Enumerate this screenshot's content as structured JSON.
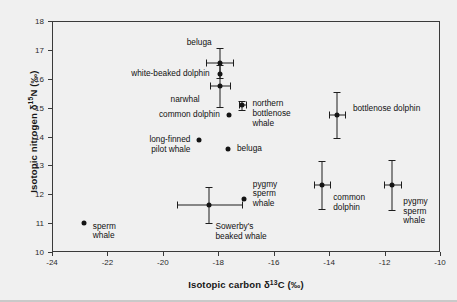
{
  "chart_data": {
    "type": "scatter",
    "title": "",
    "xlabel_parts": {
      "pre": "Isotopic carbon δ",
      "sup": "13",
      "post": "C (‰)"
    },
    "ylabel_parts": {
      "pre": "Isotopic nitrogen δ",
      "sup": "15",
      "post": "N (‰)"
    },
    "xlabel": "Isotopic carbon δ13C (‰)",
    "ylabel": "Isotopic nitrogen δ15N (‰)",
    "xlim": [
      -24,
      -10
    ],
    "ylim": [
      10,
      18
    ],
    "xticks": [
      -24,
      -22,
      -20,
      -18,
      -16,
      -14,
      -12,
      -10
    ],
    "xtick_labels": [
      "-24",
      "-22",
      "-20",
      "-18",
      "-16",
      "-14",
      "-12",
      "-10"
    ],
    "yticks": [
      10,
      11,
      12,
      13,
      14,
      15,
      16,
      17,
      18
    ],
    "ytick_labels": [
      "10",
      "11",
      "12",
      "13",
      "14",
      "15",
      "16",
      "17",
      "18"
    ],
    "grid": false,
    "legend": "none",
    "marker_color": "#141414",
    "frame_color": "#3a3a3a",
    "background_color": "#f0f0f0",
    "points": [
      {
        "label": "beluga",
        "x": -17.95,
        "y": 16.55,
        "xerr": 0.48,
        "yerr": 0.52,
        "label_pos": "top-left",
        "label_dx": -8,
        "label_dy": -20
      },
      {
        "label": "white-beaked dolphin",
        "x": -17.95,
        "y": 16.15,
        "xerr": 0.0,
        "yerr": 0.0,
        "label_pos": "left",
        "label_dx": -10,
        "label_dy": 0
      },
      {
        "label": "narwhal",
        "x": -17.95,
        "y": 15.75,
        "xerr": 0.36,
        "yerr": 0.72,
        "label_pos": "left",
        "label_dx": -20,
        "label_dy": 14
      },
      {
        "label": "northern\nbottlenose\nwhale",
        "x": -17.13,
        "y": 15.08,
        "xerr": 0.14,
        "yerr": 0.16,
        "label_pos": "right",
        "label_dx": 10,
        "label_dy": -1
      },
      {
        "label": "common dolphin",
        "x": -17.62,
        "y": 14.75,
        "xerr": 0.0,
        "yerr": 0.0,
        "label_pos": "left",
        "label_dx": -9,
        "label_dy": 0
      },
      {
        "label": "bottlenose dolphin",
        "x": -13.72,
        "y": 14.75,
        "xerr": 0.3,
        "yerr": 0.8,
        "label_pos": "right",
        "label_dx": 16,
        "label_dy": -6
      },
      {
        "label": "long-finned\npilot whale",
        "x": -18.68,
        "y": 13.88,
        "xerr": 0.0,
        "yerr": 0.0,
        "label_pos": "left",
        "label_dx": -9,
        "label_dy": 0
      },
      {
        "label": "beluga",
        "x": -17.65,
        "y": 13.55,
        "xerr": 0.0,
        "yerr": 0.0,
        "label_pos": "right",
        "label_dx": 9,
        "label_dy": 0
      },
      {
        "label": "common\ndolphin",
        "x": -14.25,
        "y": 12.32,
        "xerr": 0.28,
        "yerr": 0.82,
        "label_pos": "right",
        "label_dx": 11,
        "label_dy": 13
      },
      {
        "label": "pygmy\nsperm\nwhale",
        "x": -11.72,
        "y": 12.32,
        "xerr": 0.3,
        "yerr": 0.85,
        "label_pos": "right",
        "label_dx": 11,
        "label_dy": 17
      },
      {
        "label": "pygmy\nsperm\nwhale",
        "x": -17.08,
        "y": 11.85,
        "xerr": 0.0,
        "yerr": 0.0,
        "label_pos": "right",
        "label_dx": 9,
        "label_dy": -14
      },
      {
        "label": "Sowerby's\nbeaked whale",
        "x": -18.32,
        "y": 11.62,
        "xerr": 1.18,
        "yerr": 0.62,
        "label_pos": "right",
        "label_dx": 6,
        "label_dy": 22
      },
      {
        "label": "sperm\nwhale",
        "x": -22.85,
        "y": 11.02,
        "xerr": 0.0,
        "yerr": 0.0,
        "label_pos": "right",
        "label_dx": 9,
        "label_dy": 4
      }
    ]
  }
}
